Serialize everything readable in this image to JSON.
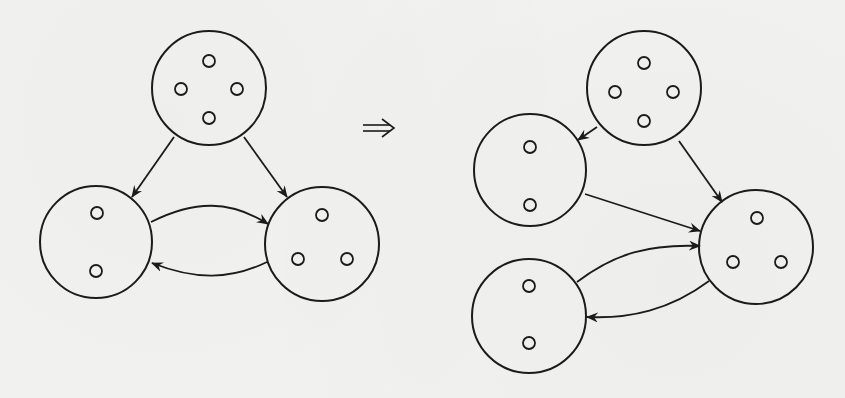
{
  "figure": {
    "transform_symbol": "⟹",
    "colors": {
      "ink": "#1b1b1b",
      "paper": "#f2f2f0"
    },
    "left_graph": {
      "nodes": [
        {
          "id": "L-top",
          "cx": 209,
          "cy": 88,
          "r": 57,
          "dots": [
            [
              209,
              61
            ],
            [
              181,
              89
            ],
            [
              237,
              89
            ],
            [
              209,
              118
            ]
          ]
        },
        {
          "id": "L-bottom-left",
          "cx": 96,
          "cy": 242,
          "r": 56,
          "dots": [
            [
              97,
              213
            ],
            [
              96,
              271
            ]
          ]
        },
        {
          "id": "L-bottom-right",
          "cx": 322,
          "cy": 244,
          "r": 57,
          "dots": [
            [
              322,
              215
            ],
            [
              298,
              259
            ],
            [
              347,
              259
            ]
          ]
        }
      ],
      "edges": [
        {
          "from": "L-top",
          "to": "L-bottom-left",
          "path": "M174,137 L132,197"
        },
        {
          "from": "L-top",
          "to": "L-bottom-right",
          "path": "M244,137 L287,197"
        },
        {
          "from": "L-bottom-left",
          "to": "L-bottom-right",
          "path": "M151,222 C195,200 230,200 268,224"
        },
        {
          "from": "L-bottom-right",
          "to": "L-bottom-left",
          "path": "M267,262 C230,280 195,280 152,263"
        }
      ]
    },
    "right_graph": {
      "nodes": [
        {
          "id": "R-top",
          "cx": 644,
          "cy": 88,
          "r": 57,
          "dots": [
            [
              644,
              63
            ],
            [
              615,
              92
            ],
            [
              673,
              92
            ],
            [
              644,
              121
            ]
          ]
        },
        {
          "id": "R-middle-left",
          "cx": 530,
          "cy": 170,
          "r": 56,
          "dots": [
            [
              530,
              147
            ],
            [
              530,
              205
            ]
          ]
        },
        {
          "id": "R-right",
          "cx": 756,
          "cy": 247,
          "r": 57,
          "dots": [
            [
              757,
              218
            ],
            [
              733,
              262
            ],
            [
              781,
              262
            ]
          ]
        },
        {
          "id": "R-bottom-left",
          "cx": 529,
          "cy": 316,
          "r": 57,
          "dots": [
            [
              529,
              286
            ],
            [
              529,
              343
            ]
          ]
        }
      ],
      "edges": [
        {
          "from": "R-top",
          "to": "R-middle-left",
          "path": "M597,127 L578,140"
        },
        {
          "from": "R-top",
          "to": "R-right",
          "path": "M679,141 L722,202"
        },
        {
          "from": "R-middle-left",
          "to": "R-right",
          "path": "M585,194 L700,231"
        },
        {
          "from": "R-bottom-left",
          "to": "R-right",
          "path": "M577,282 C615,253 650,244 700,246"
        },
        {
          "from": "R-right",
          "to": "R-bottom-left",
          "path": "M709,281 C670,310 630,319 587,317"
        }
      ]
    }
  }
}
